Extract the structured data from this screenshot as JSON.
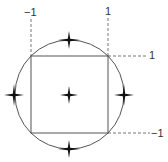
{
  "diagram": {
    "labels": {
      "x_neg": "−1",
      "x_pos": "1",
      "y_pos": "1",
      "y_neg": "−1"
    },
    "colors": {
      "stroke": "#555555",
      "dashed": "#666666",
      "star": "#111111",
      "text": "#333333"
    },
    "markers": [
      {
        "name": "center",
        "x": 69,
        "y": 95
      },
      {
        "name": "top",
        "x": 69,
        "y": 40
      },
      {
        "name": "bottom",
        "x": 69,
        "y": 149
      },
      {
        "name": "left",
        "x": 15,
        "y": 95
      },
      {
        "name": "right",
        "x": 124,
        "y": 95
      }
    ]
  }
}
